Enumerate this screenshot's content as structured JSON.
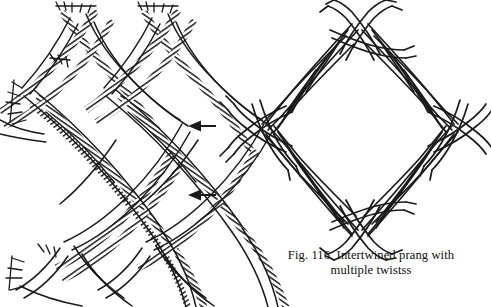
{
  "figure": {
    "caption_line_1": "Fig. 116. Intertwined prang with",
    "caption_line_2": "multiple twistss",
    "caption_full": "Fig. 116. Intertwined prang with multiple twistss",
    "figure_number": "Fig. 116.",
    "ink_color": "#1a1a1a",
    "background_color": "#ffffff"
  },
  "left_panel": {
    "name": "continuous-lattice-braid",
    "description": "Repeating lattice of intertwined multi-strand braids forming open hexagonal cells, cropped at the image edges",
    "strand_types": [
      "hatched-band",
      "plain-band"
    ],
    "cell_columns": 2,
    "cell_rows": 2,
    "frayed_ends": [
      "top-left",
      "top-right",
      "mid-left",
      "bottom-left"
    ]
  },
  "right_panel": {
    "name": "diamond-intertwined-prang",
    "description": "Closed diamond (rhombus) of intertwined twisted strands with crossed knots and protruding tips at each of the four vertices",
    "vertices": [
      "top",
      "right",
      "bottom",
      "left"
    ],
    "vertex_count": 4,
    "strand_types": [
      "plain-twisted-band"
    ]
  },
  "annotations": {
    "arrows": [
      {
        "name": "arrow-upper",
        "direction": "left",
        "x": 188,
        "y": 126
      },
      {
        "name": "arrow-lower",
        "direction": "left",
        "x": 188,
        "y": 195
      }
    ]
  }
}
